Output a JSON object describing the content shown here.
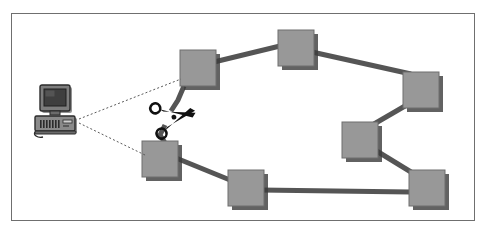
{
  "figure": {
    "background_color": "#ffffff",
    "frame": {
      "name": "figure-border",
      "x": 11,
      "y": 13,
      "width": 464,
      "height": 208,
      "stroke": "#6f6f6f",
      "stroke_width": 1
    }
  },
  "palette": {
    "node_fill": "#989898",
    "node_stroke": "#6e6e6e",
    "node_shadow": "#3b3b3b",
    "link_stroke": "#555555",
    "dotted_stroke": "#5a5a5a",
    "scissors_fill": "#111111",
    "monitor_dark": "#2b2b2b",
    "monitor_body": "#7d7d7d",
    "monitor_screen": "#4a4a4a",
    "case_body": "#8a8a8a",
    "frame_stroke": "#6f6f6f"
  },
  "nodes": [
    {
      "id": "n1",
      "label": "node-top-left",
      "x": 180,
      "y": 50,
      "size": 36
    },
    {
      "id": "n2",
      "label": "node-top-center",
      "x": 278,
      "y": 30,
      "size": 36
    },
    {
      "id": "n3",
      "label": "node-right-upper",
      "x": 403,
      "y": 72,
      "size": 36
    },
    {
      "id": "n4",
      "label": "node-right-middle",
      "x": 342,
      "y": 122,
      "size": 36
    },
    {
      "id": "n5",
      "label": "node-right-lower",
      "x": 409,
      "y": 170,
      "size": 36
    },
    {
      "id": "n6",
      "label": "node-bottom-center",
      "x": 228,
      "y": 170,
      "size": 36
    },
    {
      "id": "n7",
      "label": "node-bottom-left",
      "x": 142,
      "y": 141,
      "size": 36
    }
  ],
  "links": [
    {
      "id": "l1",
      "label": "link-top-left-to-top-center",
      "from": "n1",
      "to": "n2",
      "cut": false
    },
    {
      "id": "l2",
      "label": "link-top-center-to-right-upper",
      "from": "n2",
      "to": "n3",
      "cut": false
    },
    {
      "id": "l3",
      "label": "link-right-upper-to-right-middle",
      "from": "n3",
      "to": "n4",
      "cut": false
    },
    {
      "id": "l4",
      "label": "link-right-middle-to-right-lower",
      "from": "n4",
      "to": "n5",
      "cut": false
    },
    {
      "id": "l5",
      "label": "link-right-lower-to-bottom-center",
      "from": "n5",
      "to": "n6",
      "cut": false
    },
    {
      "id": "l6",
      "label": "link-bottom-center-to-bottom-left",
      "from": "n6",
      "to": "n7",
      "cut": false
    },
    {
      "id": "l7",
      "label": "link-bottom-left-to-top-left",
      "from": "n7",
      "to": "n1",
      "cut": true
    }
  ],
  "computer": {
    "name": "computer-workstation-icon",
    "x": 35,
    "y": 86,
    "width": 46,
    "height": 52
  },
  "scissors": {
    "name": "scissors-cut-icon",
    "x": 148,
    "y": 104,
    "width": 44,
    "height": 38,
    "rotation": -18
  },
  "probe_lines": [
    {
      "id": "p1",
      "label": "probe-line-to-top-left-node",
      "x1": 79,
      "y1": 119,
      "x2": 181,
      "y2": 79
    },
    {
      "id": "p2",
      "label": "probe-line-to-bottom-left-node",
      "x1": 79,
      "y1": 123,
      "x2": 147,
      "y2": 156
    }
  ]
}
